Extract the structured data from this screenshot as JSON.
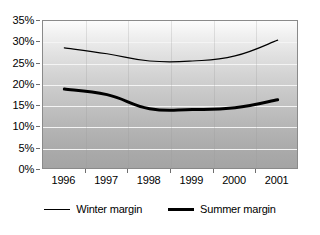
{
  "chart_data": {
    "type": "line",
    "title": "",
    "xlabel": "",
    "ylabel": "",
    "categories": [
      "1996",
      "1997",
      "1998",
      "1999",
      "2000",
      "2001"
    ],
    "ylim": [
      0,
      35
    ],
    "ytick_step": 5,
    "ytick_labels": [
      "0%",
      "5%",
      "10%",
      "15%",
      "20%",
      "25%",
      "30%",
      "35%"
    ],
    "ytick_values": [
      0,
      5,
      10,
      15,
      20,
      25,
      30,
      35
    ],
    "grid": true,
    "legend_position": "bottom",
    "series": [
      {
        "name": "Winter margin",
        "style": "thin",
        "color": "#000000",
        "values": [
          28.7,
          27.3,
          25.6,
          25.6,
          26.8,
          30.5
        ]
      },
      {
        "name": "Summer margin",
        "style": "thick",
        "color": "#000000",
        "values": [
          19.0,
          17.7,
          14.4,
          14.2,
          14.6,
          16.5
        ]
      }
    ]
  },
  "legend": {
    "entries": [
      {
        "label": "Winter margin"
      },
      {
        "label": "Summer margin"
      }
    ]
  },
  "colors": {
    "line": "#000000",
    "grid": "#f4f4f4",
    "axis": "#8a8a8a",
    "text": "#000000"
  }
}
